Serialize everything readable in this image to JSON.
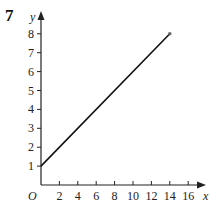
{
  "question_number": "7",
  "chart_data": {
    "type": "line",
    "title": "",
    "xlabel": "x",
    "ylabel": "y",
    "origin_label": "O",
    "x_ticks": [
      2,
      4,
      6,
      8,
      10,
      12,
      14,
      16
    ],
    "y_ticks": [
      1,
      2,
      3,
      4,
      5,
      6,
      7,
      8
    ],
    "xlim": [
      0,
      17.5
    ],
    "ylim": [
      0,
      9
    ],
    "grid": false,
    "series": [
      {
        "name": "line",
        "x": [
          0,
          14
        ],
        "y": [
          1,
          8
        ],
        "color": "#111111",
        "endpoint_marker": "dot"
      }
    ]
  }
}
